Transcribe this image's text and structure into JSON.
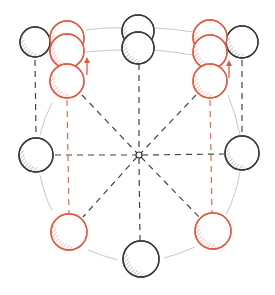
{
  "diagram": {
    "title_cut_off": "",
    "colors": {
      "gray_stroke": "#3a3a3a",
      "gray_hatch": "#9a9a9a",
      "red_stroke": "#e05a45",
      "red_hatch": "#ec9a8c",
      "dash_gray": "#444444",
      "dash_red": "#e06a55",
      "arc": "#c8c8c8"
    },
    "hub": {
      "label": "center-hub"
    },
    "spheres": [
      {
        "id": "top-left-gray",
        "color": "gray"
      },
      {
        "id": "top-center-gray-upper",
        "color": "gray"
      },
      {
        "id": "top-center-gray-lower",
        "color": "gray"
      },
      {
        "id": "top-right-gray",
        "color": "gray"
      },
      {
        "id": "left-red-1",
        "color": "red"
      },
      {
        "id": "left-red-2",
        "color": "red"
      },
      {
        "id": "left-red-3",
        "color": "red"
      },
      {
        "id": "right-red-1",
        "color": "red"
      },
      {
        "id": "right-red-2",
        "color": "red"
      },
      {
        "id": "right-red-3",
        "color": "red"
      },
      {
        "id": "middle-left-gray",
        "color": "gray"
      },
      {
        "id": "middle-right-gray",
        "color": "gray"
      },
      {
        "id": "bottom-left-red",
        "color": "red"
      },
      {
        "id": "bottom-right-red",
        "color": "red"
      },
      {
        "id": "bottom-center-gray",
        "color": "gray"
      }
    ],
    "arrows": [
      {
        "id": "left-up-arrow",
        "direction": "up",
        "color": "red"
      },
      {
        "id": "right-up-arrow",
        "direction": "up",
        "color": "red"
      }
    ]
  }
}
